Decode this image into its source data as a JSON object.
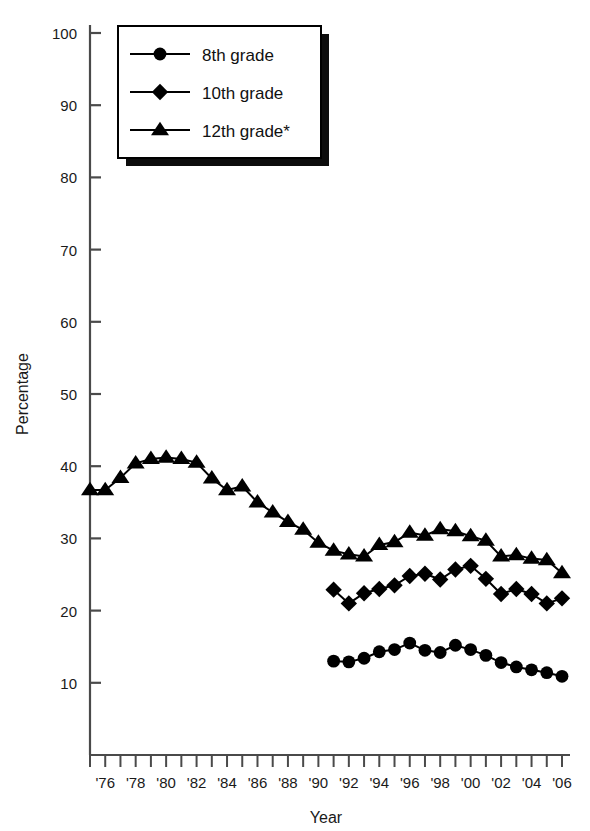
{
  "figure": {
    "ylabel": "Percentage",
    "xlabel": "Year",
    "y_ticks": [
      "10",
      "20",
      "30",
      "40",
      "50",
      "60",
      "70",
      "80",
      "90",
      "100"
    ],
    "x_tick_labels": [
      "'76",
      "'78",
      "'80",
      "'82",
      "'84",
      "'86",
      "'88",
      "'90",
      "'92",
      "'94",
      "'96",
      "'98",
      "'00",
      "'02",
      "'04",
      "'06"
    ]
  },
  "legend": {
    "items": [
      {
        "label": "8th grade",
        "marker": "circle-marker"
      },
      {
        "label": "10th grade",
        "marker": "diamond-marker"
      },
      {
        "label": "12th grade*",
        "marker": "triangle-marker"
      }
    ]
  },
  "chart_data": {
    "type": "line",
    "title": "",
    "xlabel": "Year",
    "ylabel": "Percentage",
    "xlim": [
      1975,
      2006
    ],
    "ylim": [
      0,
      100
    ],
    "ytick_values": [
      10,
      20,
      30,
      40,
      50,
      60,
      70,
      80,
      90,
      100
    ],
    "xtick_years": [
      1975,
      1976,
      1977,
      1978,
      1979,
      1980,
      1981,
      1982,
      1983,
      1984,
      1985,
      1986,
      1987,
      1988,
      1989,
      1990,
      1991,
      1992,
      1993,
      1994,
      1995,
      1996,
      1997,
      1998,
      1999,
      2000,
      2001,
      2002,
      2003,
      2004,
      2005,
      2006
    ],
    "xtick_labeled_years": [
      1976,
      1978,
      1980,
      1982,
      1984,
      1986,
      1988,
      1990,
      1992,
      1994,
      1996,
      1998,
      2000,
      2002,
      2004,
      2006
    ],
    "grid": false,
    "legend_position": "upper-left-inset",
    "series": [
      {
        "name": "8th grade",
        "marker": "circle",
        "x": [
          1991,
          1992,
          1993,
          1994,
          1995,
          1996,
          1997,
          1998,
          1999,
          2000,
          2001,
          2002,
          2003,
          2004,
          2005,
          2006
        ],
        "values": [
          13.0,
          12.9,
          13.4,
          14.3,
          14.6,
          15.5,
          14.5,
          14.2,
          15.2,
          14.6,
          13.8,
          12.8,
          12.2,
          11.8,
          11.4,
          10.9
        ]
      },
      {
        "name": "10th grade",
        "marker": "diamond",
        "x": [
          1991,
          1992,
          1993,
          1994,
          1995,
          1996,
          1997,
          1998,
          1999,
          2000,
          2001,
          2002,
          2003,
          2004,
          2005,
          2006
        ],
        "values": [
          22.9,
          21.0,
          22.4,
          23.0,
          23.5,
          24.8,
          25.1,
          24.3,
          25.7,
          26.2,
          24.4,
          22.3,
          23.0,
          22.3,
          21.0,
          21.7
        ]
      },
      {
        "name": "12th grade*",
        "marker": "triangle",
        "x": [
          1975,
          1976,
          1977,
          1978,
          1979,
          1980,
          1981,
          1982,
          1983,
          1984,
          1985,
          1986,
          1987,
          1988,
          1989,
          1990,
          1991,
          1992,
          1993,
          1994,
          1995,
          1996,
          1997,
          1998,
          1999,
          2000,
          2001,
          2002,
          2003,
          2004,
          2005,
          2006
        ],
        "values": [
          36.7,
          36.7,
          38.4,
          40.4,
          41.0,
          41.2,
          41.0,
          40.5,
          38.3,
          36.7,
          37.2,
          35.0,
          33.6,
          32.3,
          31.2,
          29.4,
          28.3,
          27.8,
          27.5,
          29.1,
          29.5,
          30.8,
          30.4,
          31.3,
          31.0,
          30.3,
          29.7,
          27.5,
          27.7,
          27.2,
          27.0,
          25.2
        ]
      }
    ]
  },
  "colors": {
    "ink": "#000000",
    "axis": "#4a4a4a",
    "background": "#ffffff"
  }
}
